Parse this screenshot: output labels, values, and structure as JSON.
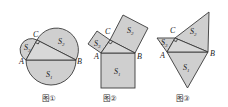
{
  "figures": [
    {
      "id": "fig1",
      "caption": "图①",
      "shape_type": "semicircle",
      "vertices": {
        "A": "A",
        "B": "B",
        "C": "C"
      },
      "areas": [
        {
          "name": "S",
          "sub": "1"
        },
        {
          "name": "S",
          "sub": "2"
        },
        {
          "name": "S",
          "sub": "3"
        }
      ]
    },
    {
      "id": "fig2",
      "caption": "图②",
      "shape_type": "square",
      "vertices": {
        "A": "A",
        "B": "B",
        "C": "C"
      },
      "areas": [
        {
          "name": "S",
          "sub": "1"
        },
        {
          "name": "S",
          "sub": "2"
        },
        {
          "name": "S",
          "sub": "3"
        }
      ]
    },
    {
      "id": "fig3",
      "caption": "图③",
      "shape_type": "equilateral-triangle",
      "vertices": {
        "A": "A",
        "B": "B",
        "C": "C"
      },
      "areas": [
        {
          "name": "S",
          "sub": "1"
        },
        {
          "name": "S",
          "sub": "2"
        },
        {
          "name": "S",
          "sub": "3"
        }
      ]
    }
  ],
  "colors": {
    "fill": "#cfcfcf",
    "stroke": "#3a3a3a",
    "background": "#ffffff"
  }
}
